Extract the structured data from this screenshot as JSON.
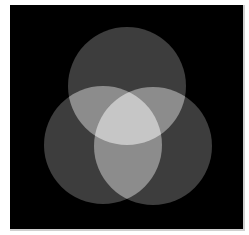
{
  "figure": {
    "background": "#000000",
    "frame_color": "#ffffff",
    "circles": [
      {
        "id": "top",
        "cx": 127,
        "cy": 86,
        "r": 59
      },
      {
        "id": "left",
        "cx": 103,
        "cy": 145,
        "r": 59
      },
      {
        "id": "right",
        "cx": 153,
        "cy": 146,
        "r": 59
      }
    ],
    "fill_colors": {
      "single": "#3d3d3d",
      "double": "#8c8c8c",
      "triple": "#c6c6c6"
    }
  }
}
